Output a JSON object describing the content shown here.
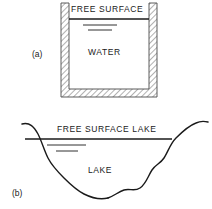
{
  "figure": {
    "width": 212,
    "height": 209,
    "background_color": "#ffffff",
    "line_color": "#1a1a1a",
    "hatch_color": "#8a8a8a"
  },
  "panel_a": {
    "tag": "(a)",
    "free_surface_label": "FREE SURFACE",
    "body_label": "WATER",
    "container": {
      "shape": "open-top rectangular tank",
      "wall_style": "hatched",
      "outer_left": 61,
      "outer_right": 157,
      "outer_top": 3,
      "outer_bottom": 97,
      "wall_thickness": 8
    },
    "free_surface_line": {
      "x1": 69,
      "x2": 149,
      "y": 19
    },
    "ripple_lines": [
      {
        "x1": 83,
        "x2": 117,
        "y": 25
      },
      {
        "x1": 88,
        "x2": 112,
        "y": 30
      }
    ]
  },
  "panel_b": {
    "tag": "(b)",
    "free_surface_label": "FREE SURFACE LAKE",
    "body_label": "LAKE",
    "basin": {
      "shape": "irregular lake cross-section with sloping banks and undulating bed",
      "left_bank_top_x": 22,
      "right_bank_top_x": 200
    },
    "free_surface_line": {
      "x1": 25,
      "x2": 172,
      "y": 139
    },
    "ripple_lines": [
      {
        "x1": 47,
        "x2": 86,
        "y": 145
      },
      {
        "x1": 56,
        "x2": 78,
        "y": 151
      }
    ]
  }
}
